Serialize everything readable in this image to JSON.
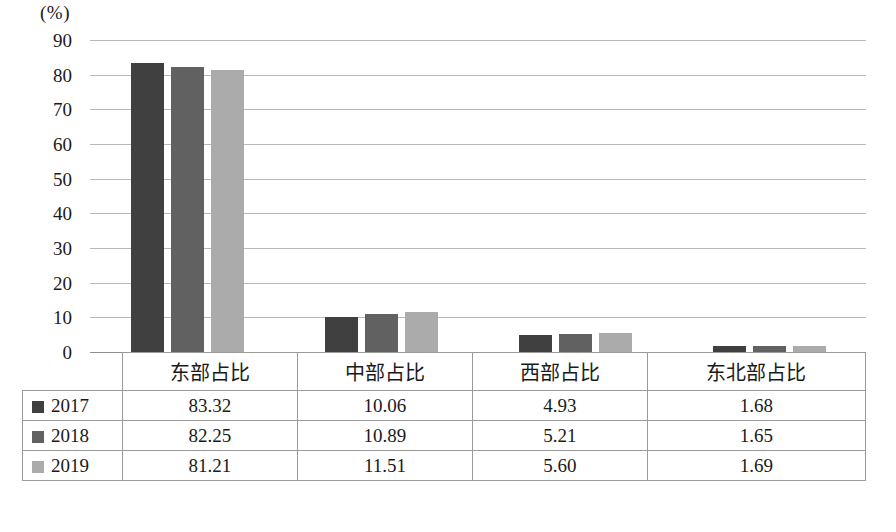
{
  "chart_data": {
    "type": "bar",
    "title": "",
    "subtitle": "",
    "xlabel": "",
    "ylabel": "(%)",
    "unit_label": "(%)",
    "categories": [
      "东部占比",
      "中部占比",
      "西部占比",
      "东北部占比"
    ],
    "series": [
      {
        "name": "2017",
        "color": "#404040",
        "values": [
          83.32,
          10.06,
          4.93,
          1.68
        ]
      },
      {
        "name": "2018",
        "color": "#616161",
        "values": [
          82.25,
          10.89,
          5.21,
          1.65
        ]
      },
      {
        "name": "2019",
        "color": "#ababab",
        "values": [
          81.21,
          11.51,
          5.6,
          1.69
        ]
      }
    ],
    "ylim": [
      0,
      90
    ],
    "yticks": [
      90,
      80,
      70,
      60,
      50,
      40,
      30,
      20,
      10,
      0
    ],
    "ytick_labels": [
      "90",
      "80",
      "70",
      "60",
      "50",
      "40",
      "30",
      "20",
      "10",
      "0"
    ],
    "grid": true,
    "gridlines": "horizontal",
    "legend_position": "table-row-headers",
    "data_table_visible": true
  },
  "table": {
    "headers": [
      "",
      "东部占比",
      "中部占比",
      "西部占比",
      "东北部占比"
    ],
    "rows": [
      {
        "label": "2017",
        "color": "#404040",
        "cells": [
          "83.32",
          "10.06",
          "4.93",
          "1.68"
        ]
      },
      {
        "label": "2018",
        "color": "#616161",
        "cells": [
          "82.25",
          "10.89",
          "5.21",
          "1.65"
        ]
      },
      {
        "label": "2019",
        "color": "#ababab",
        "cells": [
          "81.21",
          "11.51",
          "5.60",
          "1.69"
        ]
      }
    ]
  },
  "caption": {
    "text": ""
  }
}
